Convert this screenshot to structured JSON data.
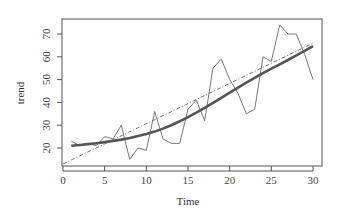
{
  "chart_data": {
    "type": "line",
    "title": "",
    "xlabel": "Time",
    "ylabel": "trend",
    "xlim": [
      0,
      30
    ],
    "ylim": [
      13,
      77
    ],
    "grid": false,
    "legend": null,
    "x_ticks": [
      0,
      5,
      10,
      15,
      20,
      25,
      30
    ],
    "y_ticks": [
      20,
      30,
      40,
      50,
      60,
      70
    ],
    "x": [
      1,
      2,
      3,
      4,
      5,
      6,
      7,
      8,
      9,
      10,
      11,
      12,
      13,
      14,
      15,
      16,
      17,
      18,
      19,
      20,
      21,
      22,
      23,
      24,
      25,
      26,
      27,
      28,
      29,
      30
    ],
    "series": [
      {
        "name": "observed",
        "style": "thin-solid",
        "color": "#777777",
        "values": [
          23,
          21,
          22,
          21,
          25,
          24,
          30,
          15,
          20,
          19,
          36,
          24,
          22,
          22,
          37,
          41,
          32,
          55,
          59,
          50,
          44,
          35,
          37,
          60,
          58,
          74,
          70,
          70,
          61,
          50
        ]
      },
      {
        "name": "smoothed",
        "style": "thick-solid",
        "color": "#555555",
        "values": [
          21,
          21.3,
          21.7,
          22.1,
          22.6,
          23.1,
          23.7,
          24.4,
          25.2,
          26.1,
          27.2,
          28.5,
          30,
          31.7,
          33.5,
          35.5,
          37.6,
          39.8,
          42,
          44.3,
          46.5,
          48.7,
          50.8,
          52.8,
          54.8,
          56.7,
          58.6,
          60.6,
          62.6,
          64.7
        ]
      },
      {
        "name": "linear-fit",
        "style": "dash-dot",
        "color": "#666666",
        "x": [
          0,
          30
        ],
        "values": [
          13,
          66
        ]
      }
    ]
  }
}
